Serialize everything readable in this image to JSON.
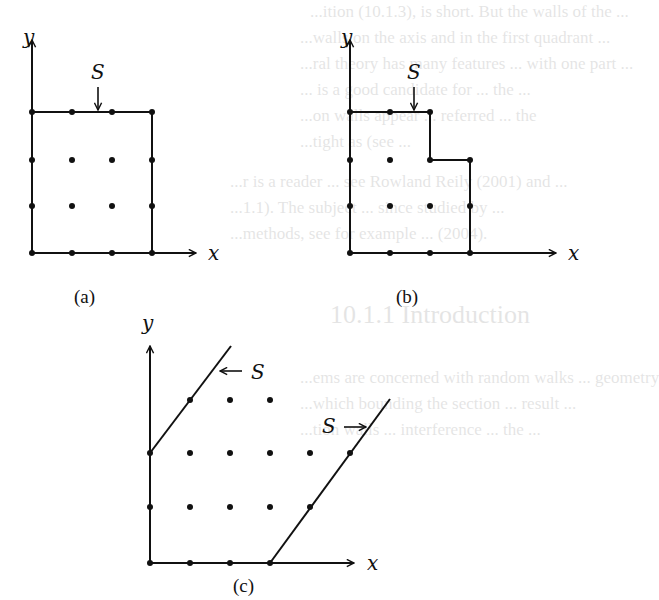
{
  "figure": {
    "panels": [
      {
        "id": "a",
        "caption": "(a)",
        "axis_x_label": "x",
        "axis_y_label": "y",
        "surface_label": "S",
        "surface_arrow": "down",
        "description": "Square boundary: 4x4 lattice points, wall along top row and right column"
      },
      {
        "id": "b",
        "caption": "(b)",
        "axis_x_label": "x",
        "axis_y_label": "y",
        "surface_label": "S",
        "surface_arrow": "down",
        "description": "Stepped boundary: wall steps down one row after two columns"
      },
      {
        "id": "c",
        "caption": "(c)",
        "axis_x_label": "x",
        "axis_y_label": "y",
        "surface_label_left": "S",
        "surface_arrow_left": "left",
        "surface_label_right": "S",
        "surface_arrow_right": "right",
        "description": "Slanted parallel boundaries enclosing a sheared lattice strip"
      }
    ]
  },
  "bleed_through_text": [
    "...ition (10.1.3), is short. But the walls of the ...",
    "...walls on the axis and in the first quadrant ...",
    "...ral theory has many features ... with one part ...",
    "... is a good candidate for ... the ...",
    "...on walls appear ... referred ... the",
    "...tight as (see ...",
    "...r is a reader ... see Rowland Reily (2001) and ...",
    "...1.1). The subject ... since studied by ...",
    "...methods, see for example ... (2004).",
    "10.1.1 Introduction",
    "...ems are concerned with random walks ... geometry",
    "...which bounding the section ... result ...",
    "...tion walls ... interference ... the ..."
  ]
}
